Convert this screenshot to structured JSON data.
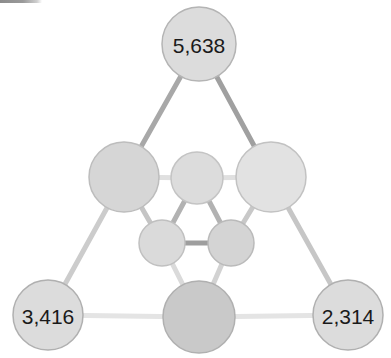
{
  "figure": {
    "type": "network-diagram",
    "background_color": "#ffffff",
    "width": 391,
    "height": 358,
    "artifact": {
      "name": "top-left-gray-bar",
      "color": "#8c8c8c"
    }
  },
  "chart_data": {
    "type": "diagram",
    "title": "",
    "subtitle": "",
    "xlabel": "",
    "ylabel": "",
    "legend": [],
    "grid": false,
    "layout": "triangular-network",
    "nodes": [
      {
        "id": "top",
        "label": "5,638",
        "cx": 199,
        "cy": 44,
        "r": 37,
        "fill": "#dcdcdc",
        "stroke": "#b4b4b4",
        "labeled": true
      },
      {
        "id": "mid-left",
        "label": "",
        "cx": 124,
        "cy": 177,
        "r": 35,
        "fill": "#d6d6d6",
        "stroke": "#bdbdbd",
        "labeled": false
      },
      {
        "id": "mid-right",
        "label": "",
        "cx": 271,
        "cy": 177,
        "r": 35,
        "fill": "#e2e2e2",
        "stroke": "#c2c2c2",
        "labeled": false
      },
      {
        "id": "inner-top",
        "label": "",
        "cx": 197,
        "cy": 178,
        "r": 26,
        "fill": "#dcdcdc",
        "stroke": "#c4c4c4",
        "labeled": false
      },
      {
        "id": "inner-bottom-left",
        "label": "",
        "cx": 162,
        "cy": 243,
        "r": 23,
        "fill": "#dadada",
        "stroke": "#c0c0c0",
        "labeled": false
      },
      {
        "id": "inner-bottom-right",
        "label": "",
        "cx": 231,
        "cy": 243,
        "r": 23,
        "fill": "#d4d4d4",
        "stroke": "#bababa",
        "labeled": false
      },
      {
        "id": "bottom-left",
        "label": "3,416",
        "cx": 48,
        "cy": 315,
        "r": 35,
        "fill": "#dcdcdc",
        "stroke": "#b0b0b0",
        "labeled": true
      },
      {
        "id": "bottom-center",
        "label": "",
        "cx": 199,
        "cy": 317,
        "r": 36,
        "fill": "#c9c9c9",
        "stroke": "#b0b0b0",
        "labeled": false
      },
      {
        "id": "bottom-right",
        "label": "2,314",
        "cx": 348,
        "cy": 315,
        "r": 35,
        "fill": "#dcdcdc",
        "stroke": "#b0b0b0",
        "labeled": true
      }
    ],
    "edges": [
      {
        "source": "top",
        "target": "mid-left",
        "color": "#a8a8a8",
        "width": 5
      },
      {
        "source": "top",
        "target": "mid-right",
        "color": "#a0a0a0",
        "width": 5
      },
      {
        "source": "mid-left",
        "target": "inner-top",
        "color": "#e0e0e0",
        "width": 5
      },
      {
        "source": "inner-top",
        "target": "mid-right",
        "color": "#e0e0e0",
        "width": 5
      },
      {
        "source": "mid-left",
        "target": "inner-bottom-left",
        "color": "#c4c4c4",
        "width": 5
      },
      {
        "source": "mid-right",
        "target": "inner-bottom-right",
        "color": "#c8c8c8",
        "width": 5
      },
      {
        "source": "inner-top",
        "target": "inner-bottom-left",
        "color": "#b2b2b2",
        "width": 5
      },
      {
        "source": "inner-top",
        "target": "inner-bottom-right",
        "color": "#b2b2b2",
        "width": 5
      },
      {
        "source": "inner-bottom-left",
        "target": "inner-bottom-right",
        "color": "#9e9e9e",
        "width": 5
      },
      {
        "source": "inner-bottom-left",
        "target": "bottom-center",
        "color": "#dadada",
        "width": 5
      },
      {
        "source": "inner-bottom-right",
        "target": "bottom-center",
        "color": "#d2d2d2",
        "width": 5
      },
      {
        "source": "mid-left",
        "target": "bottom-left",
        "color": "#cccccc",
        "width": 5
      },
      {
        "source": "mid-right",
        "target": "bottom-right",
        "color": "#c6c6c6",
        "width": 5
      },
      {
        "source": "bottom-left",
        "target": "bottom-center",
        "color": "#e4e4e4",
        "width": 5
      },
      {
        "source": "bottom-center",
        "target": "bottom-right",
        "color": "#e4e4e4",
        "width": 5
      }
    ],
    "values": [
      5638,
      3416,
      2314
    ],
    "categories": [
      "top",
      "bottom-left",
      "bottom-right"
    ]
  }
}
